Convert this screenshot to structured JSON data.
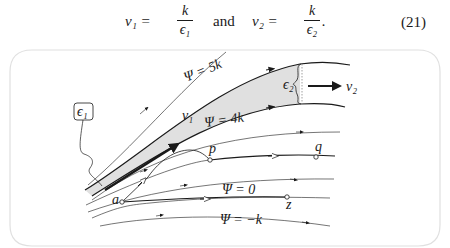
{
  "equation": {
    "lhs1": "v₁ =",
    "frac1": {
      "numerator": "k",
      "denominator": "ϵ₁"
    },
    "connector": "and",
    "lhs2": "v₂ =",
    "frac2": {
      "numerator": "k",
      "denominator": "ϵ₂"
    },
    "trailing": ".",
    "number": "(21)"
  },
  "figure": {
    "labels": {
      "psi_5k": "Ψ = 5k",
      "psi_4k": "Ψ = 4k",
      "psi_0": "Ψ = 0",
      "psi_neg_k": "Ψ = −k",
      "v1": "v₁",
      "v2": "v₂",
      "eps1": "ϵ₁",
      "eps2": "ϵ₂",
      "point_a": "a",
      "point_p": "p",
      "point_q": "q",
      "point_z": "z"
    },
    "colors": {
      "shaded_tube": "#e0e0e0",
      "stroke": "#1a1a1a",
      "frame": "#dddddd"
    }
  }
}
